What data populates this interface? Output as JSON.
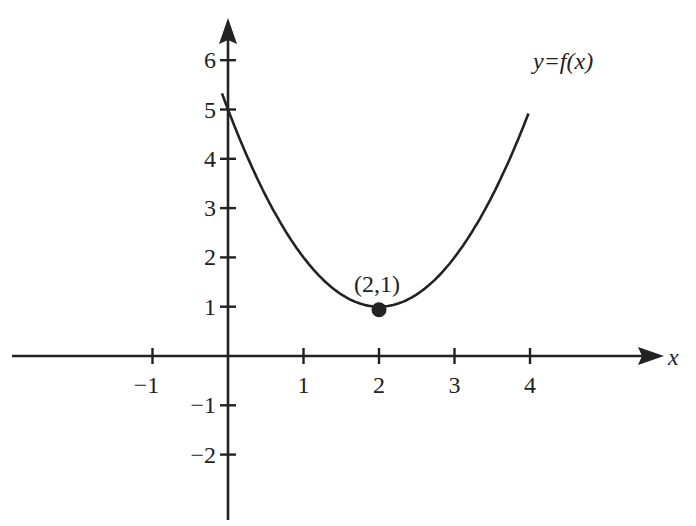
{
  "chart_data": {
    "type": "line",
    "title": "",
    "function_label": "y=f(x)",
    "xlabel": "x",
    "ylabel": "",
    "xlim": [
      -2.9,
      5.8
    ],
    "ylim": [
      -3.3,
      6.6
    ],
    "grid": false,
    "x_ticks": [
      -1,
      1,
      2,
      3,
      4
    ],
    "x_tick_labels": [
      "−1",
      "1",
      "2",
      "3",
      "4"
    ],
    "y_ticks": [
      -2,
      -1,
      1,
      2,
      3,
      4,
      5,
      6
    ],
    "y_tick_labels": [
      "−2",
      "−1",
      "1",
      "2",
      "3",
      "4",
      "5",
      "6"
    ],
    "curve": {
      "formula": "f(x) = (x-2)^2 + 1",
      "x_range": [
        -0.08,
        3.98
      ],
      "points": [
        {
          "x": 0,
          "y": 5
        },
        {
          "x": 0.5,
          "y": 3.25
        },
        {
          "x": 1,
          "y": 2
        },
        {
          "x": 1.5,
          "y": 1.25
        },
        {
          "x": 2,
          "y": 1
        },
        {
          "x": 2.5,
          "y": 1.25
        },
        {
          "x": 3,
          "y": 2
        },
        {
          "x": 3.5,
          "y": 3.25
        },
        {
          "x": 4,
          "y": 5
        }
      ]
    },
    "annotations": [
      {
        "type": "point",
        "x": 2,
        "y": 1,
        "label": "(2,1)"
      }
    ]
  },
  "labels": {
    "function": "y=f(x)",
    "x_axis": "x",
    "vertex": "(2,1)"
  }
}
